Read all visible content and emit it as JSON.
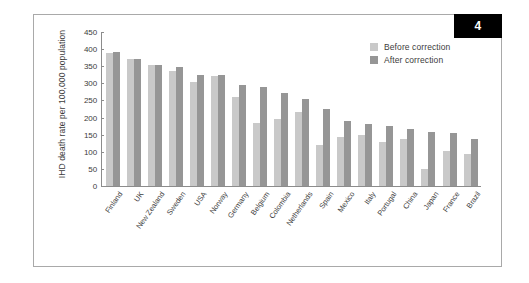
{
  "figure": {
    "badge_number": "4",
    "frame_border_color": "#a9a9a9",
    "badge_background": "#000000"
  },
  "legend": {
    "position": "top-right",
    "entries": [
      {
        "label": "Before correction",
        "color": "#c9c9c9",
        "icon": "square-swatch-icon"
      },
      {
        "label": "After correction",
        "color": "#969696",
        "icon": "square-swatch-icon"
      }
    ]
  },
  "chart_data": {
    "type": "bar",
    "title": "",
    "xlabel": "",
    "ylabel": "IHD death rate per 100,000 population",
    "ylim": [
      0,
      450
    ],
    "yticks": [
      450,
      400,
      350,
      300,
      250,
      200,
      150,
      100,
      50,
      0
    ],
    "grid": false,
    "legend_position": "top-right",
    "categories": [
      "Finland",
      "UK",
      "New Zealand",
      "Sweden",
      "USA",
      "Norway",
      "Germany",
      "Belgium",
      "Colombia",
      "Netherlands",
      "Spain",
      "Mexico",
      "Italy",
      "Portugal",
      "China",
      "Japan",
      "France",
      "Brazil"
    ],
    "series": [
      {
        "name": "Before correction",
        "color": "#c9c9c9",
        "values": [
          390,
          370,
          355,
          335,
          305,
          322,
          261,
          183,
          197,
          215,
          119,
          142,
          148,
          128,
          138,
          51,
          102,
          93
        ]
      },
      {
        "name": "After correction",
        "color": "#969696",
        "values": [
          391,
          370,
          355,
          348,
          325,
          324,
          294,
          289,
          271,
          255,
          224,
          189,
          182,
          174,
          167,
          159,
          156,
          136
        ]
      }
    ]
  }
}
